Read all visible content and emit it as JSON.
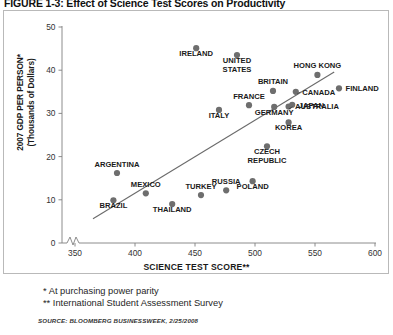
{
  "figure": {
    "title": "FIGURE 1-3: Effect of Science Test Scores on Productivity"
  },
  "footnotes": {
    "line1": "* At purchasing power parity",
    "line2": "** International Student Assessment Survey",
    "source": "SOURCE: BLOOMBERG BUSINESSWEEK, 2/25/2008"
  },
  "chart_data": {
    "type": "scatter",
    "title": "Effect of Science Test Scores on Productivity",
    "xlabel": "SCIENCE TEST SCORE**",
    "ylabel": "2007 GDP PER PERSON* (Thousands of Dollars)",
    "ylabel_line1": "2007 GDP PER PERSON*",
    "ylabel_line2": "(Thousands of Dollars)",
    "xlim": [
      337,
      600
    ],
    "ylim": [
      0,
      50
    ],
    "xticks": [
      350,
      400,
      450,
      500,
      550,
      600
    ],
    "yticks": [
      0,
      10,
      20,
      30,
      40,
      50
    ],
    "grid": false,
    "axis_break": true,
    "legend": "none",
    "trendline": {
      "x0": 365,
      "y0": 5.6,
      "x1": 566,
      "y1": 39.6
    },
    "points": [
      {
        "label": "IRELAND",
        "x": 451,
        "y": 45.1,
        "lx": 431,
        "ly": 45.1,
        "anchor": "middle",
        "dy": 7.5
      },
      {
        "label": "UNITED STATES",
        "x": 485,
        "y": 43.5,
        "lx": 485,
        "ly": 43.5,
        "anchor": "middle",
        "dy": 8.0,
        "lines": 2
      },
      {
        "label": "HONG KONG",
        "x": 552,
        "y": 38.9,
        "lx": 552,
        "ly": 38.9,
        "anchor": "middle",
        "dy": -6.5
      },
      {
        "label": "BRITAIN",
        "x": 515,
        "y": 35.2,
        "lx": 515,
        "ly": 35.2,
        "anchor": "middle",
        "dy": -6.5
      },
      {
        "label": "FINLAND",
        "x": 570,
        "y": 35.8,
        "lx": 570,
        "ly": 35.8,
        "anchor": "start",
        "dy": 2.8
      },
      {
        "label": "CANADA",
        "x": 534,
        "y": 35.0,
        "lx": 534,
        "ly": 35.0,
        "anchor": "start",
        "dy": 2.8,
        "leader": true
      },
      {
        "label": "JAPAN",
        "x": 531,
        "y": 32.0,
        "lx": 531,
        "ly": 32.0,
        "anchor": "start",
        "dy": 2.8
      },
      {
        "label": "AUSTRALIA",
        "x": 528,
        "y": 31.6,
        "lx": 528,
        "ly": 31.6,
        "anchor": "start",
        "dy": 2.8,
        "leader": true
      },
      {
        "label": "FRANCE",
        "x": 495,
        "y": 31.9,
        "lx": 495,
        "ly": 31.9,
        "anchor": "middle",
        "dy": -6.5
      },
      {
        "label": "GERMANY",
        "x": 516,
        "y": 31.5,
        "lx": 516,
        "ly": 31.5,
        "anchor": "middle",
        "dy": 8.0
      },
      {
        "label": "ITALY",
        "x": 470,
        "y": 30.8,
        "lx": 470,
        "ly": 30.8,
        "anchor": "middle",
        "dy": 8.0
      },
      {
        "label": "KOREA",
        "x": 528,
        "y": 27.9,
        "lx": 528,
        "ly": 27.9,
        "anchor": "middle",
        "dy": 8.0
      },
      {
        "label": "CZECH REPUBLIC",
        "x": 510,
        "y": 22.4,
        "lx": 510,
        "ly": 22.4,
        "anchor": "middle",
        "dy": 8.0,
        "lines": 2
      },
      {
        "label": "ARGENTINA",
        "x": 385,
        "y": 16.2,
        "lx": 385,
        "ly": 16.2,
        "anchor": "middle",
        "dy": -6.5
      },
      {
        "label": "POLAND",
        "x": 498,
        "y": 14.3,
        "lx": 498,
        "ly": 14.3,
        "anchor": "middle",
        "dy": 8.0
      },
      {
        "label": "RUSSIA",
        "x": 476,
        "y": 12.2,
        "lx": 476,
        "ly": 12.2,
        "anchor": "middle",
        "dy": -6.5
      },
      {
        "label": "MEXICO",
        "x": 409,
        "y": 11.5,
        "lx": 409,
        "ly": 11.5,
        "anchor": "middle",
        "dy": -6.5
      },
      {
        "label": "BRAZIL",
        "x": 382,
        "y": 9.9,
        "lx": 382,
        "ly": 9.9,
        "anchor": "middle",
        "dy": 8.0
      },
      {
        "label": "TURKEY",
        "x": 455,
        "y": 11.1,
        "lx": 455,
        "ly": 11.1,
        "anchor": "middle",
        "dy": -6.5
      },
      {
        "label": "THAILAND",
        "x": 431,
        "y": 9.0,
        "lx": 431,
        "ly": 9.0,
        "anchor": "middle",
        "dy": 8.0
      }
    ]
  }
}
